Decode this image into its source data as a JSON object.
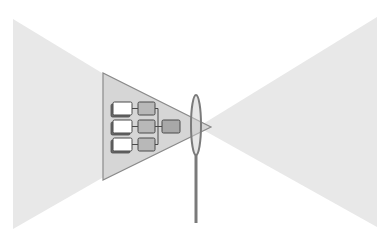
{
  "diagram": {
    "colors": {
      "background": "#ffffff",
      "cone_fill": "#e8e8e8",
      "inner_triangle_fill": "#d6d6d6",
      "inner_triangle_stroke": "#8a8a8a",
      "input_box_fill": "#ffffff",
      "input_box_shadow": "#6a6a6a",
      "process_box_fill": "#b8b8b8",
      "output_box_fill": "#a8a8a8",
      "box_stroke": "#4a4a4a",
      "lens_stroke": "#7a7a7a",
      "lens_fill": "#cfcfcf"
    },
    "left_cone": {
      "points": [
        [
          13,
          19
        ],
        [
          13,
          229
        ],
        [
          191,
          127
        ]
      ]
    },
    "right_cone": {
      "points": [
        [
          377,
          17
        ],
        [
          377,
          227
        ],
        [
          198,
          127
        ]
      ]
    },
    "inner_triangle": {
      "points": [
        [
          103,
          73
        ],
        [
          103,
          180
        ],
        [
          211,
          127
        ]
      ]
    },
    "lens": {
      "cx": 196,
      "cy": 125,
      "rx": 5,
      "ry": 30,
      "stem_x": 196,
      "stem_top": 155,
      "stem_bottom": 223
    },
    "input_boxes": [
      {
        "x": 113,
        "y": 102,
        "w": 19,
        "h": 13
      },
      {
        "x": 113,
        "y": 120,
        "w": 19,
        "h": 13
      },
      {
        "x": 113,
        "y": 138,
        "w": 19,
        "h": 13
      }
    ],
    "process_boxes": [
      {
        "x": 138,
        "y": 102,
        "w": 17,
        "h": 13
      },
      {
        "x": 138,
        "y": 120,
        "w": 17,
        "h": 13
      },
      {
        "x": 138,
        "y": 138,
        "w": 17,
        "h": 13
      }
    ],
    "output_box": {
      "x": 162,
      "y": 120,
      "w": 18,
      "h": 13
    }
  }
}
